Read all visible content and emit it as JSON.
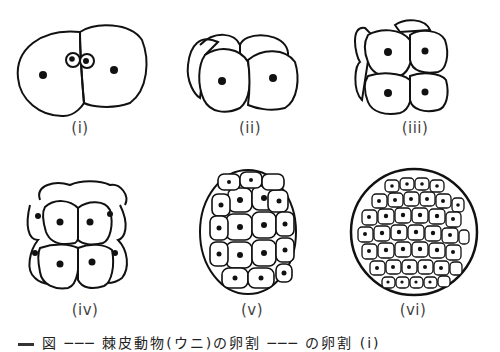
{
  "figure": {
    "panels": [
      {
        "id": "i",
        "label": "(i)",
        "stage": "2-cell stage with polar bodies"
      },
      {
        "id": "ii",
        "label": "(ii)",
        "stage": "4-cell stage"
      },
      {
        "id": "iii",
        "label": "(iii)",
        "stage": "8-cell stage"
      },
      {
        "id": "iv",
        "label": "(iv)",
        "stage": "16-cell stage"
      },
      {
        "id": "v",
        "label": "(v)",
        "stage": "32-cell stage / morula"
      },
      {
        "id": "vi",
        "label": "(vi)",
        "stage": "blastula"
      }
    ],
    "caption": "図 ─── 棘皮動物(ウニ)の卵割 ─── の卵割 (i)"
  }
}
